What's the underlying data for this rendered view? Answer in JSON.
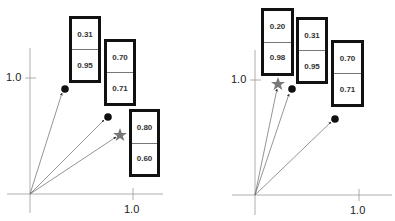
{
  "panels": [
    {
      "id": "left",
      "axis": {
        "origin": [
          30,
          194
        ],
        "x_tick_label": "1.0",
        "y_tick_label": "1.0"
      },
      "vectors": [
        {
          "marker": "dot",
          "x": 0.31,
          "y": 0.95,
          "values": [
            "0.31",
            "0.95"
          ]
        },
        {
          "marker": "dot",
          "x": 0.7,
          "y": 0.71,
          "values": [
            "0.70",
            "0.71"
          ]
        },
        {
          "marker": "star",
          "x": 0.8,
          "y": 0.6,
          "values": [
            "0.80",
            "0.60"
          ]
        }
      ]
    },
    {
      "id": "right",
      "axis": {
        "origin": [
          255,
          195
        ],
        "x_tick_label": "1.0",
        "y_tick_label": "1.0"
      },
      "vectors": [
        {
          "marker": "star",
          "x": 0.2,
          "y": 0.98,
          "values": [
            "0.20",
            "0.98"
          ]
        },
        {
          "marker": "dot",
          "x": 0.31,
          "y": 0.95,
          "values": [
            "0.31",
            "0.95"
          ]
        },
        {
          "marker": "dot",
          "x": 0.7,
          "y": 0.71,
          "values": [
            "0.70",
            "0.71"
          ]
        }
      ]
    }
  ],
  "colors": {
    "axis": "#999999",
    "vector": "#666666",
    "dot": "#111111",
    "star": "#777777",
    "box_border": "#111111"
  }
}
